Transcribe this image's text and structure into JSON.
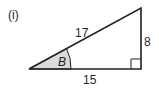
{
  "figure": {
    "part_label": "(i)",
    "angle_label": "B",
    "sides": {
      "hypotenuse": "17",
      "opposite": "8",
      "adjacent": "15"
    },
    "right_angle": "bottom-right",
    "angle_fill_color": "#d9d9d9",
    "line_color": "#231f20"
  }
}
